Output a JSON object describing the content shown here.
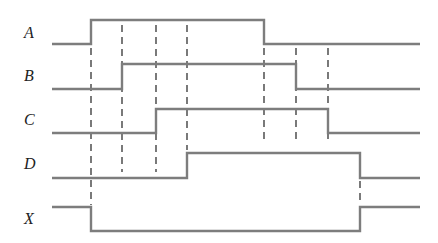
{
  "diagram": {
    "title": "",
    "type": "timing-diagram",
    "colors": {
      "signal_line": "#7d7d7d",
      "guide_line": "#333333",
      "label": "#222222",
      "background": "#ffffff"
    },
    "x_start": 52,
    "x_end": 420,
    "transition_x": [
      91,
      122,
      156,
      187,
      264,
      296,
      328,
      360
    ],
    "signals": [
      {
        "name": "A",
        "label_y": 33,
        "low_y": 44,
        "high_y": 20,
        "initial": 0,
        "edges": [
          {
            "x": 91,
            "to": 1
          },
          {
            "x": 264,
            "to": 0
          }
        ]
      },
      {
        "name": "B",
        "label_y": 76,
        "low_y": 89,
        "high_y": 64,
        "initial": 0,
        "edges": [
          {
            "x": 122,
            "to": 1
          },
          {
            "x": 296,
            "to": 0
          }
        ]
      },
      {
        "name": "C",
        "label_y": 120,
        "low_y": 133,
        "high_y": 109,
        "initial": 0,
        "edges": [
          {
            "x": 156,
            "to": 1
          },
          {
            "x": 328,
            "to": 0
          }
        ]
      },
      {
        "name": "D",
        "label_y": 164,
        "low_y": 178,
        "high_y": 153,
        "initial": 0,
        "edges": [
          {
            "x": 187,
            "to": 1
          },
          {
            "x": 360,
            "to": 0
          }
        ]
      },
      {
        "name": "X",
        "label_y": 219,
        "low_y": 231,
        "high_y": 207,
        "initial": 1,
        "edges": [
          {
            "x": 91,
            "to": 0
          },
          {
            "x": 360,
            "to": 1
          }
        ]
      }
    ],
    "guides": [
      {
        "x": 91,
        "y1": 48,
        "y2": 205
      },
      {
        "x": 122,
        "y1": 25,
        "y2": 172
      },
      {
        "x": 156,
        "y1": 25,
        "y2": 172
      },
      {
        "x": 187,
        "y1": 25,
        "y2": 150
      },
      {
        "x": 264,
        "y1": 48,
        "y2": 140
      },
      {
        "x": 296,
        "y1": 48,
        "y2": 140
      },
      {
        "x": 328,
        "y1": 48,
        "y2": 140
      },
      {
        "x": 360,
        "y1": 181,
        "y2": 205
      }
    ]
  }
}
